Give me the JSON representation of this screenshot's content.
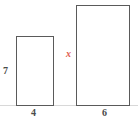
{
  "figure": {
    "type": "geometry-diagram",
    "background_color": "#ffffff",
    "stroke_color": "#5a5a5a",
    "label_color": "#4a4a4a",
    "accent_color": "#e05a4e"
  },
  "baseline": {
    "name": "ground-line",
    "color": "#d8d8d8"
  },
  "shapes": [
    {
      "id": "small-rectangle",
      "kind": "rectangle",
      "height_label": "7",
      "height_label_position": "left",
      "width_label": "4",
      "width_label_position": "bottom",
      "height_label_is_unknown": false,
      "width_label_is_unknown": false
    },
    {
      "id": "large-rectangle",
      "kind": "rectangle",
      "height_label": "x",
      "height_label_position": "left",
      "width_label": "6",
      "width_label_position": "bottom",
      "height_label_is_unknown": true,
      "width_label_is_unknown": false
    }
  ],
  "chart_data": {
    "type": "table",
    "title": "",
    "categories": [
      "small-rectangle",
      "large-rectangle"
    ],
    "series": [
      {
        "name": "width",
        "values": [
          "4",
          "6"
        ]
      },
      {
        "name": "height",
        "values": [
          "7",
          "x"
        ]
      }
    ],
    "unknowns": [
      "x"
    ],
    "grid": false,
    "legend": "none"
  }
}
